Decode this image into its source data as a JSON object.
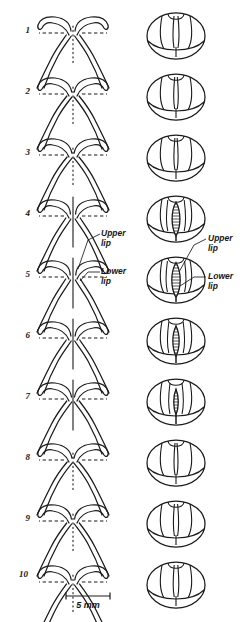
{
  "figure": {
    "background_color": "#ffffff",
    "ink_color": "#1a1a1a",
    "rows": [
      {
        "number": "1",
        "aperture": "wide-flared-open",
        "slit_open": false,
        "slit_length": 0,
        "slit_width": 0,
        "oval_center_gap": 4.0
      },
      {
        "number": "2",
        "aperture": "narrowing",
        "slit_open": false,
        "slit_length": 0,
        "slit_width": 0,
        "oval_center_gap": 2.6
      },
      {
        "number": "3",
        "aperture": "narrow-channel",
        "slit_open": false,
        "slit_length": 0,
        "slit_width": 0,
        "oval_center_gap": 2.2
      },
      {
        "number": "4",
        "aperture": "slit-opening",
        "slit_open": true,
        "slit_length": 34.0,
        "slit_width": 5.2,
        "oval_center_gap": 5.2
      },
      {
        "number": "5",
        "aperture": "slit-maximal",
        "slit_open": true,
        "slit_length": 35.0,
        "slit_width": 5.6,
        "oval_center_gap": 5.6
      },
      {
        "number": "6",
        "aperture": "slit-closing",
        "slit_open": true,
        "slit_length": 30.0,
        "slit_width": 4.2,
        "oval_center_gap": 4.2
      },
      {
        "number": "7",
        "aperture": "slit-narrow",
        "slit_open": true,
        "slit_length": 26.0,
        "slit_width": 3.0,
        "oval_center_gap": 3.0
      },
      {
        "number": "8",
        "aperture": "closed",
        "slit_open": false,
        "slit_length": 0,
        "slit_width": 0,
        "oval_center_gap": 2.0
      },
      {
        "number": "9",
        "aperture": "closed-relaxing",
        "slit_open": false,
        "slit_length": 0,
        "slit_width": 0,
        "oval_center_gap": 3.2
      },
      {
        "number": "10",
        "aperture": "closed-rest",
        "slit_open": false,
        "slit_length": 0,
        "slit_width": 0,
        "oval_center_gap": 3.6
      }
    ],
    "annotations": {
      "upper_lip_left": "Upper\nlip",
      "lower_lip_left": "Lower\nlip",
      "upper_lip_right": "Upper\nlip",
      "lower_lip_right": "Lower\nlip",
      "annotated_row": "5"
    },
    "scale_bar": {
      "label": "5 mm",
      "length_px": 44
    },
    "panels": {
      "left_view": "sagittal-profile",
      "right_view": "frontal-oval"
    }
  }
}
